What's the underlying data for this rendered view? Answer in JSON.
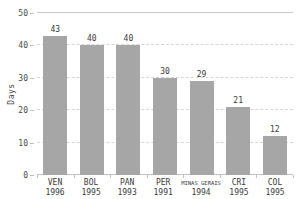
{
  "chart_data": {
    "type": "bar",
    "title": "",
    "xlabel": "",
    "ylabel": "Days",
    "ylim": [
      0,
      50
    ],
    "yticks": [
      0,
      10,
      20,
      30,
      40,
      50
    ],
    "grid": "horizontal-dashed, solid line at 50 and baseline at 0",
    "legend": "none",
    "bars": [
      {
        "code": "VEN",
        "year": "1996",
        "value": 43
      },
      {
        "code": "BOL",
        "year": "1995",
        "value": 40
      },
      {
        "code": "PAN",
        "year": "1993",
        "value": 40
      },
      {
        "code": "PER",
        "year": "1991",
        "value": 30
      },
      {
        "code": "MINAS GERAIS",
        "year": "1994",
        "value": 29
      },
      {
        "code": "CRI",
        "year": "1995",
        "value": 21
      },
      {
        "code": "COL",
        "year": "1995",
        "value": 12
      }
    ],
    "colors": {
      "bar": "#a6a6a6",
      "gridline": "#d6d6d6",
      "axis_line": "#c2c2c2",
      "value_text": "#3a3a3a",
      "axis_text": "#4a4a4a",
      "background": "#ffffff"
    }
  }
}
